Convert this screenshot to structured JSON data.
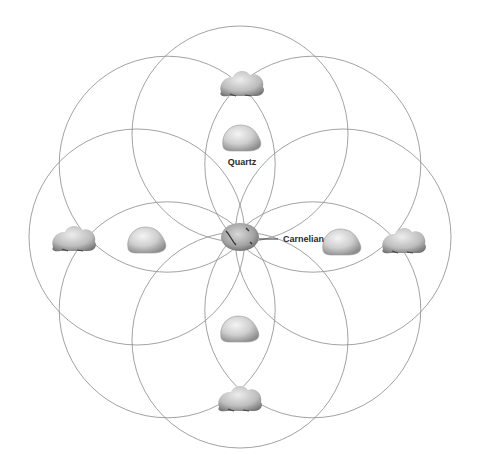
{
  "diagram": {
    "title": "",
    "pattern": "flower of life crystal grid",
    "circle_count": 8,
    "line_color": "#8a8a8a",
    "center_stone": {
      "name": "Carnelian",
      "label": "Carnelian",
      "color": "#9a9a9a"
    },
    "inner_stones": {
      "name": "Quartz",
      "type": "tumbled",
      "count": 4,
      "label": "Quartz"
    },
    "outer_stones": {
      "name": "Quartz cluster",
      "type": "rough",
      "count": 4
    },
    "labels": {
      "quartz": "Quartz",
      "carnelian": "Carnelian"
    }
  }
}
